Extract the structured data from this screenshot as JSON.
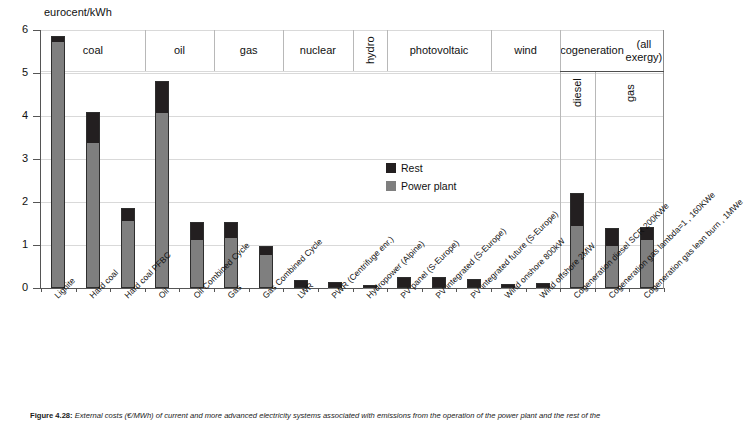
{
  "figure": {
    "caption_label": "Figure 4.28:",
    "caption_text": " External costs (€/MWh) of current and more advanced electricity systems associated with emissions from the operation of the power plant and the rest of the"
  },
  "legend": {
    "position": "inside-center",
    "items": [
      {
        "label": "Rest",
        "color": "#231f20",
        "name": "rest"
      },
      {
        "label": "Power plant",
        "color": "#7f7f7f",
        "name": "power-plant"
      }
    ]
  },
  "groups": [
    {
      "label": "coal",
      "orientation": "horizontal",
      "span": 3
    },
    {
      "label": "oil",
      "orientation": "horizontal",
      "span": 2
    },
    {
      "label": "gas",
      "orientation": "horizontal",
      "span": 2
    },
    {
      "label": "nuclear",
      "orientation": "horizontal",
      "span": 2
    },
    {
      "label": "hydro",
      "orientation": "vertical",
      "span": 1
    },
    {
      "label": "photovoltaic",
      "orientation": "horizontal",
      "span": 3
    },
    {
      "label": "wind",
      "orientation": "horizontal",
      "span": 2
    },
    {
      "label": "cogeneration\n(all exergy)",
      "orientation": "horizontal",
      "span": 3
    }
  ],
  "subgroups": [
    {
      "label": "diesel",
      "orientation": "vertical",
      "span": 1
    },
    {
      "label": "gas",
      "orientation": "vertical",
      "span": 2
    }
  ],
  "chart_data": {
    "type": "bar",
    "subtype": "stacked",
    "title": "",
    "subtitle": "",
    "xlabel": "",
    "ylabel": "eurocent/kWh",
    "ylim": [
      0,
      6
    ],
    "yticks": [
      0,
      1,
      2,
      3,
      4,
      5,
      6
    ],
    "ytick_labels": [
      "0",
      "1",
      "2",
      "3",
      "4",
      "5",
      "6"
    ],
    "grid": "horizontal",
    "legend_position": "inside-center",
    "categories": [
      "Lignite",
      "Hard coal",
      "Hard coal PFBC",
      "Oil",
      "Oil Combined Cycle",
      "Gas",
      "Gas Combined Cycle",
      "LWR",
      "PWR (Centrifuge  enr.)",
      "Hydropower (Alpine)",
      "PV panel (S-Europe)",
      "PV integrated (S-Europe)",
      "PV integrated future (S-Europe)",
      "Wind onshore 800kW",
      "Wind offshore 2MW",
      "Cogeneration diesel SCR 200KWe",
      "Cogeneration gas lambda=1 , 160KWe",
      "Cogeneration gas lean burn , 1MWe"
    ],
    "group_of_category": [
      "coal",
      "coal",
      "coal",
      "oil",
      "oil",
      "gas",
      "gas",
      "nuclear",
      "nuclear",
      "hydro",
      "photovoltaic",
      "photovoltaic",
      "photovoltaic",
      "wind",
      "wind",
      "cogeneration (all exergy) - diesel",
      "cogeneration (all exergy) - gas",
      "cogeneration (all exergy) - gas"
    ],
    "series": [
      {
        "name": "Power plant",
        "color": "#7f7f7f",
        "values": [
          5.72,
          3.38,
          1.55,
          4.07,
          1.12,
          1.17,
          0.76,
          0.02,
          0.01,
          0.01,
          0.02,
          0.02,
          0.01,
          0.01,
          0.01,
          1.44,
          0.98,
          1.12
        ]
      },
      {
        "name": "Rest",
        "color": "#231f20",
        "values": [
          0.13,
          0.72,
          0.3,
          0.75,
          0.42,
          0.37,
          0.21,
          0.17,
          0.13,
          0.06,
          0.24,
          0.23,
          0.19,
          0.09,
          0.1,
          0.78,
          0.41,
          0.3
        ]
      }
    ],
    "totals": [
      5.85,
      4.1,
      1.85,
      4.82,
      1.54,
      1.54,
      0.97,
      0.19,
      0.14,
      0.07,
      0.26,
      0.25,
      0.2,
      0.1,
      0.11,
      2.22,
      1.39,
      1.42
    ]
  }
}
